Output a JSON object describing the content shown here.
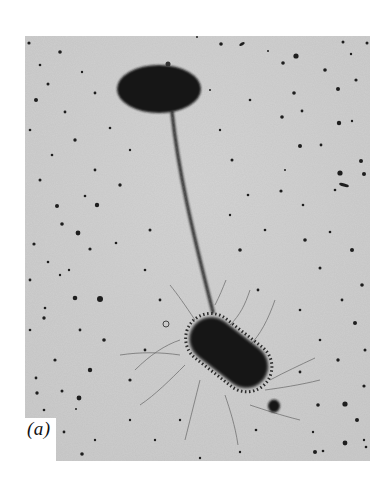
{
  "figure": {
    "panel_label": "(a)",
    "colors": {
      "page_background": "#ffffff",
      "micrograph_background": "#d4d4d4",
      "cell_dark": "#151515",
      "filament": "#3a3a3a"
    }
  }
}
